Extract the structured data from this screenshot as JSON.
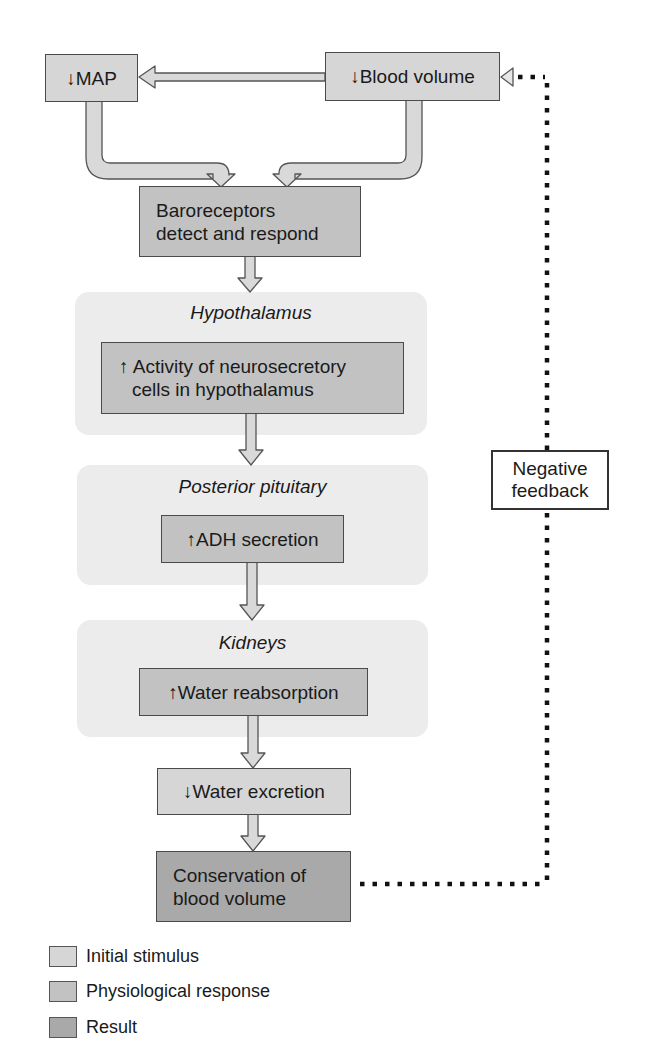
{
  "diagram": {
    "type": "flowchart",
    "topic": "Negative feedback regulation of blood volume via ADH",
    "nodes": {
      "map": {
        "arrow": "↓",
        "label": "MAP",
        "category": "initial_stimulus"
      },
      "blood_volume": {
        "arrow": "↓",
        "label": "Blood volume",
        "category": "initial_stimulus"
      },
      "baroreceptors": {
        "line1": "Baroreceptors",
        "line2": "detect and respond",
        "category": "physiological_response"
      },
      "hypothalamus_activity": {
        "arrow": "↑",
        "line1": "Activity of neurosecretory",
        "line2": "cells in hypothalamus",
        "category": "physiological_response"
      },
      "adh_secretion": {
        "arrow": "↑",
        "label": "ADH secretion",
        "category": "physiological_response"
      },
      "water_reabsorption": {
        "arrow": "↑",
        "label": "Water reabsorption",
        "category": "physiological_response"
      },
      "water_excretion": {
        "arrow": "↓",
        "label": "Water excretion",
        "category": "initial_stimulus"
      },
      "conservation": {
        "line1": "Conservation of",
        "line2": "blood volume",
        "category": "result"
      }
    },
    "regions": {
      "hypothalamus": "Hypothalamus",
      "posterior_pituitary": "Posterior pituitary",
      "kidneys": "Kidneys"
    },
    "feedback": {
      "line1": "Negative",
      "line2": "feedback"
    },
    "edges": [
      [
        "blood_volume",
        "map"
      ],
      [
        "map",
        "baroreceptors"
      ],
      [
        "blood_volume",
        "baroreceptors"
      ],
      [
        "baroreceptors",
        "hypothalamus_activity"
      ],
      [
        "hypothalamus_activity",
        "adh_secretion"
      ],
      [
        "adh_secretion",
        "water_reabsorption"
      ],
      [
        "water_reabsorption",
        "water_excretion"
      ],
      [
        "water_excretion",
        "conservation"
      ],
      [
        "conservation",
        "blood_volume",
        "negative feedback (dotted)"
      ]
    ]
  },
  "legend": [
    {
      "label": "Initial stimulus",
      "color": "#d6d6d6"
    },
    {
      "label": "Physiological response",
      "color": "#c2c2c2"
    },
    {
      "label": "Result",
      "color": "#a9a9a9"
    }
  ],
  "colors": {
    "stimulus": "#d6d6d6",
    "response": "#c2c2c2",
    "result": "#a9a9a9",
    "region_bg": "#ececec",
    "arrow_fill": "#d9d9d9",
    "outline": "#4a4a4a"
  }
}
